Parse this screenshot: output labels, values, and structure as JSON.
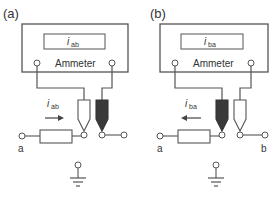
{
  "figure": {
    "panels": [
      {
        "id": "a",
        "panel_label": "(a)",
        "meter_label": "Ammeter",
        "display_symbol": "i",
        "display_subscript": "ab",
        "current_symbol": "i",
        "current_subscript": "ab",
        "current_direction": "right",
        "node_left_label": "a",
        "node_right_label": ""
      },
      {
        "id": "b",
        "panel_label": "(b)",
        "meter_label": "Ammeter",
        "display_symbol": "i",
        "display_subscript": "ba",
        "current_symbol": "i",
        "current_subscript": "ba",
        "current_direction": "left",
        "node_left_label": "a",
        "node_right_label": "b"
      }
    ],
    "colors": {
      "line": "#555555",
      "probe_dark": "#3a3a3a",
      "probe_light": "#ffffff"
    }
  }
}
